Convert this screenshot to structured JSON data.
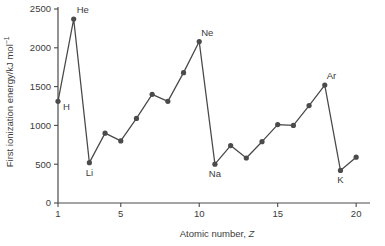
{
  "chart_data": {
    "type": "line",
    "title": "",
    "xlabel": "Atomic number, Z",
    "xlabel_plain": "Atomic number,",
    "xlabel_italic": "Z",
    "ylabel": "First ionization energy/kJ mol⁻¹",
    "ylabel_plain": "First ionization energy/kJ mol",
    "ylabel_exponent": "−1",
    "xlim": [
      1,
      20.5
    ],
    "ylim": [
      0,
      2500
    ],
    "xticks": [
      1,
      5,
      10,
      15,
      20
    ],
    "xtick_labels": [
      "1",
      "5",
      "10",
      "15",
      "20"
    ],
    "yticks": [
      0,
      500,
      1000,
      1500,
      2000,
      2500
    ],
    "ytick_labels": [
      "0",
      "500",
      "1000",
      "1500",
      "2000",
      "2500"
    ],
    "grid": false,
    "legend": false,
    "marker": "circle",
    "line_color": "#484848",
    "marker_color": "#4b4b4b",
    "axis_color": "#4a4a4a",
    "x": [
      1,
      2,
      3,
      4,
      5,
      6,
      7,
      8,
      9,
      10,
      11,
      12,
      13,
      14,
      15,
      16,
      17,
      18,
      19,
      20
    ],
    "values": [
      1310,
      2370,
      520,
      900,
      800,
      1090,
      1400,
      1310,
      1680,
      2080,
      500,
      740,
      580,
      790,
      1010,
      1000,
      1255,
      1520,
      420,
      590
    ],
    "series": [
      {
        "name": "First ionization energy",
        "values": [
          1310,
          2370,
          520,
          900,
          800,
          1090,
          1400,
          1310,
          1680,
          2080,
          500,
          740,
          580,
          790,
          1010,
          1000,
          1255,
          1520,
          420,
          590
        ]
      }
    ],
    "annotations": [
      {
        "text": "H",
        "x": 1,
        "y": 1310,
        "dx": 5,
        "dy": 9,
        "anchor": "start"
      },
      {
        "text": "He",
        "x": 2,
        "y": 2370,
        "dx": 3,
        "dy": -6,
        "anchor": "start"
      },
      {
        "text": "Li",
        "x": 3,
        "y": 520,
        "dx": 0,
        "dy": 13,
        "anchor": "middle"
      },
      {
        "text": "Ne",
        "x": 10,
        "y": 2080,
        "dx": 2,
        "dy": -6,
        "anchor": "start"
      },
      {
        "text": "Na",
        "x": 11,
        "y": 500,
        "dx": 0,
        "dy": 13,
        "anchor": "middle"
      },
      {
        "text": "Ar",
        "x": 18,
        "y": 1520,
        "dx": 2,
        "dy": -6,
        "anchor": "start"
      },
      {
        "text": "K",
        "x": 19,
        "y": 420,
        "dx": 0,
        "dy": 13,
        "anchor": "middle"
      }
    ]
  }
}
